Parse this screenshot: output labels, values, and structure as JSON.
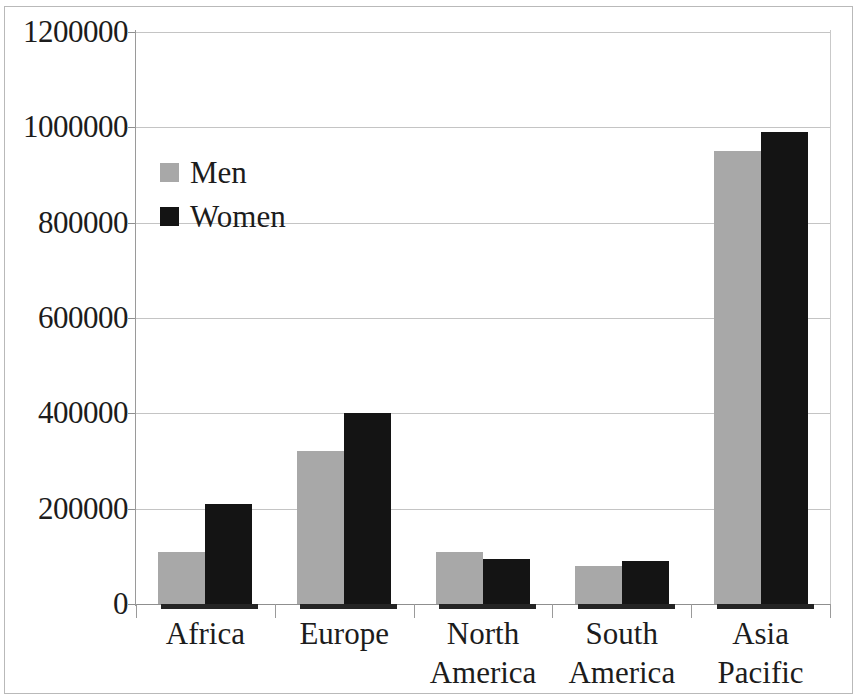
{
  "chart_data": {
    "type": "bar",
    "title": "",
    "subtitle": "",
    "xlabel": "",
    "ylabel": "",
    "categories": [
      "Africa",
      "Europe",
      "North America",
      "South America",
      "Asia Pacific"
    ],
    "category_lines": [
      [
        "Africa"
      ],
      [
        "Europe"
      ],
      [
        "North",
        "America"
      ],
      [
        "South",
        "America"
      ],
      [
        "Asia",
        "Pacific"
      ]
    ],
    "series": [
      {
        "name": "Men",
        "color": "#a8a8a8",
        "values": [
          110000,
          320000,
          110000,
          80000,
          950000
        ]
      },
      {
        "name": "Women",
        "color": "#141414",
        "values": [
          210000,
          400000,
          95000,
          90000,
          990000
        ]
      }
    ],
    "ylim": [
      0,
      1200000
    ],
    "ytick_values": [
      0,
      200000,
      400000,
      600000,
      800000,
      1000000,
      1200000
    ],
    "ytick_labels": [
      "0",
      "200000",
      "400000",
      "600000",
      "800000",
      "1000000",
      "1200000"
    ],
    "grid": true,
    "grid_axis": "y",
    "legend_position": "upper-left-inside",
    "legend_entries": [
      "Men",
      "Women"
    ],
    "annotations": []
  },
  "figure": {
    "background_color": "#ffffff",
    "border_color": "#b9b9b9",
    "gridline_color": "#c4c4c4",
    "axis_color": "#8f8f8f",
    "text_color": "#1c1c1c"
  }
}
